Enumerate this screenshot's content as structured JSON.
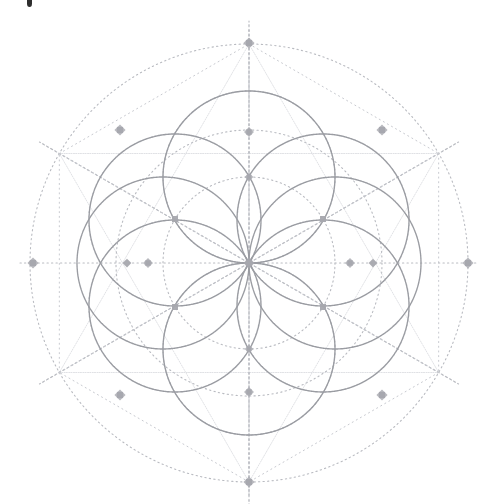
{
  "figure": {
    "background_color": "#ffffff",
    "width": 496,
    "height": 504,
    "center": {
      "x": 249,
      "y": 263
    },
    "unit_radius": 86,
    "colors": {
      "solid_stroke": "#9a9ca2",
      "dotted_stroke": "#b9bbc1",
      "faint_stroke": "#c8cad0",
      "node_fill": "#a6a8ae",
      "speck": "#1c1c1c"
    },
    "stroke_widths": {
      "solid": 1.4,
      "dotted": 1.1,
      "faint": 1.0
    },
    "dash_patterns": {
      "dotted": "1.3 3.2",
      "fine_dotted": "1.1 3.6"
    },
    "solid_circles": [
      {
        "name": "petal-circle-top",
        "cx": 249,
        "cy": 177,
        "r": 86
      },
      {
        "name": "petal-circle-upper-right",
        "cx": 323,
        "cy": 220,
        "r": 86
      },
      {
        "name": "petal-circle-lower-right",
        "cx": 323,
        "cy": 306,
        "r": 86
      },
      {
        "name": "petal-circle-bottom",
        "cx": 249,
        "cy": 349,
        "r": 86
      },
      {
        "name": "petal-circle-lower-left",
        "cx": 175,
        "cy": 306,
        "r": 86
      },
      {
        "name": "petal-circle-upper-left",
        "cx": 175,
        "cy": 220,
        "r": 86
      },
      {
        "name": "petal-circle-left",
        "cx": 163,
        "cy": 263,
        "r": 86
      },
      {
        "name": "petal-circle-right",
        "cx": 335,
        "cy": 263,
        "r": 86
      }
    ],
    "dotted_circles": [
      {
        "name": "outer-boundary-circle",
        "cx": 249,
        "cy": 263,
        "r": 219
      },
      {
        "name": "mid-ring-circle",
        "cx": 249,
        "cy": 263,
        "r": 133
      },
      {
        "name": "inner-ring-circle",
        "cx": 249,
        "cy": 263,
        "r": 86
      },
      {
        "name": "halo-circle-top",
        "cx": 249,
        "cy": 177,
        "r": 86
      },
      {
        "name": "halo-circle-bottom",
        "cx": 249,
        "cy": 349,
        "r": 86
      }
    ],
    "axis_lines": [
      {
        "name": "axis-horizontal",
        "x1": 20,
        "y1": 263,
        "x2": 478,
        "y2": 263
      },
      {
        "name": "axis-vertical",
        "x1": 249,
        "y1": 30,
        "x2": 249,
        "y2": 495
      }
    ],
    "radial_spokes_deg": [
      30,
      90,
      150,
      210,
      270,
      330
    ],
    "spoke_inner_r": 0,
    "spoke_outer_r": 242,
    "hex_vertices_r": 219,
    "nodes": [
      {
        "name": "node-center",
        "x": 249,
        "y": 263,
        "size": 9,
        "shape": "star-diamond"
      },
      {
        "name": "node-axis-north",
        "x": 249,
        "y": 43,
        "size": 9,
        "shape": "star-diamond"
      },
      {
        "name": "node-axis-south",
        "x": 249,
        "y": 482,
        "size": 9,
        "shape": "star-diamond"
      },
      {
        "name": "node-axis-west",
        "x": 33,
        "y": 263,
        "size": 9,
        "shape": "star-diamond"
      },
      {
        "name": "node-axis-east",
        "x": 468,
        "y": 263,
        "size": 9,
        "shape": "star-diamond"
      },
      {
        "name": "node-hex-nw",
        "x": 120,
        "y": 130,
        "size": 9,
        "shape": "star-diamond"
      },
      {
        "name": "node-hex-ne",
        "x": 382,
        "y": 130,
        "size": 9,
        "shape": "star-diamond"
      },
      {
        "name": "node-hex-sw",
        "x": 120,
        "y": 395,
        "size": 9,
        "shape": "star-diamond"
      },
      {
        "name": "node-hex-se",
        "x": 382,
        "y": 395,
        "size": 9,
        "shape": "star-diamond"
      },
      {
        "name": "node-ring-north",
        "x": 249,
        "y": 132,
        "size": 8,
        "shape": "star-diamond"
      },
      {
        "name": "node-ring-south",
        "x": 249,
        "y": 392,
        "size": 8,
        "shape": "star-diamond"
      },
      {
        "name": "node-ring-west",
        "x": 127,
        "y": 263,
        "size": 7,
        "shape": "diamond"
      },
      {
        "name": "node-ring-east",
        "x": 373,
        "y": 263,
        "size": 7,
        "shape": "diamond"
      },
      {
        "name": "node-petal-nw",
        "x": 175,
        "y": 219,
        "size": 6,
        "shape": "square"
      },
      {
        "name": "node-petal-ne",
        "x": 323,
        "y": 219,
        "size": 6,
        "shape": "square"
      },
      {
        "name": "node-petal-sw",
        "x": 175,
        "y": 307,
        "size": 6,
        "shape": "square"
      },
      {
        "name": "node-petal-se",
        "x": 323,
        "y": 307,
        "size": 6,
        "shape": "square"
      },
      {
        "name": "node-vesica-top",
        "x": 249,
        "y": 177,
        "size": 7,
        "shape": "star-diamond"
      },
      {
        "name": "node-vesica-bottom",
        "x": 249,
        "y": 349,
        "size": 7,
        "shape": "star-diamond"
      },
      {
        "name": "node-cross-west",
        "x": 148,
        "y": 263,
        "size": 8,
        "shape": "star-diamond"
      },
      {
        "name": "node-cross-east",
        "x": 350,
        "y": 263,
        "size": 8,
        "shape": "star-diamond"
      }
    ],
    "artifact": {
      "name": "top-edge-speck",
      "x": 27,
      "y": 0,
      "w": 5,
      "h": 7
    }
  }
}
